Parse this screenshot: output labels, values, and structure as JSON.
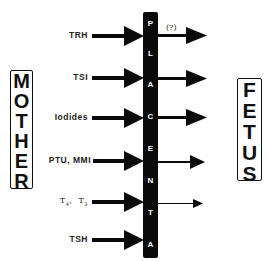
{
  "diagram": {
    "left_entity": {
      "label": "MOTHER",
      "letters": [
        "M",
        "O",
        "T",
        "H",
        "E",
        "R"
      ]
    },
    "right_entity": {
      "label": "FETUS",
      "letters": [
        "F",
        "E",
        "T",
        "U",
        "S"
      ]
    },
    "barrier": {
      "label": "PLACENTA",
      "letters": [
        "P",
        "L",
        "A",
        "C",
        "E",
        "N",
        "T",
        "A"
      ],
      "color": "#0a0a0a",
      "text_color": "#ffffff"
    },
    "rows": [
      {
        "substance": "TRH",
        "y": 36,
        "crosses": true,
        "transfer_strength": "high",
        "annotation": "(?)"
      },
      {
        "substance": "TSI",
        "y": 78,
        "crosses": true,
        "transfer_strength": "high",
        "annotation": ""
      },
      {
        "substance": "Iodides",
        "y": 118,
        "crosses": true,
        "transfer_strength": "high",
        "annotation": ""
      },
      {
        "substance": "PTU, MMI",
        "y": 161,
        "crosses": true,
        "transfer_strength": "medium",
        "annotation": ""
      },
      {
        "substance": "T4, T3",
        "y": 202,
        "crosses": true,
        "transfer_strength": "low",
        "annotation": ""
      },
      {
        "substance": "TSH",
        "y": 240,
        "crosses": false,
        "transfer_strength": "none",
        "annotation": ""
      }
    ],
    "t_label": {
      "t4_base": "T",
      "t4_sub": "4",
      "sep": ",  ",
      "t3_base": "T",
      "t3_sub": "3"
    }
  }
}
